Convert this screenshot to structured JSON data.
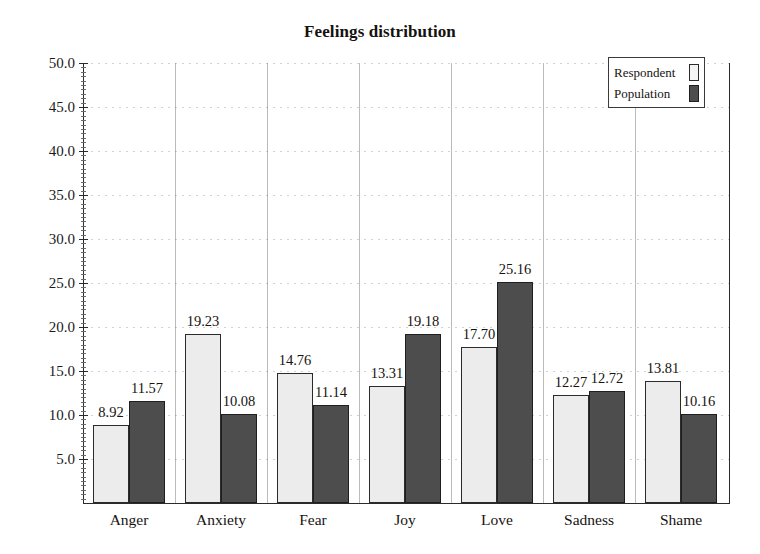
{
  "chart_data": {
    "type": "bar",
    "title": "Feelings distribution",
    "xlabel": "",
    "ylabel": "",
    "ylim": [
      0,
      50
    ],
    "ytick_step": 5,
    "grid": true,
    "legend_position": "top-right",
    "categories": [
      "Anger",
      "Anxiety",
      "Fear",
      "Joy",
      "Love",
      "Sadness",
      "Shame"
    ],
    "series": [
      {
        "name": "Respondent",
        "color": "#ececec",
        "values": [
          8.92,
          19.23,
          14.76,
          13.31,
          17.7,
          12.27,
          13.81
        ],
        "labels": [
          "8.92",
          "19.23",
          "14.76",
          "13.31",
          "17.70",
          "12.27",
          "13.81"
        ]
      },
      {
        "name": "Population",
        "color": "#4d4d4d",
        "values": [
          11.57,
          10.08,
          11.14,
          19.18,
          25.16,
          12.72,
          10.16
        ],
        "labels": [
          "11.57",
          "10.08",
          "11.14",
          "19.18",
          "25.16",
          "12.72",
          "10.16"
        ]
      }
    ],
    "yticks": [
      {
        "value": 50,
        "label": "50.0"
      },
      {
        "value": 45,
        "label": "45.0"
      },
      {
        "value": 40,
        "label": "40.0"
      },
      {
        "value": 35,
        "label": "35.0"
      },
      {
        "value": 30,
        "label": "30.0"
      },
      {
        "value": 25,
        "label": "25.0"
      },
      {
        "value": 20,
        "label": "20.0"
      },
      {
        "value": 15,
        "label": "15.0"
      },
      {
        "value": 10,
        "label": "10.0"
      },
      {
        "value": 5,
        "label": "5.0"
      }
    ]
  },
  "legend": {
    "items": [
      {
        "label": "Respondent",
        "swatch": "respondent"
      },
      {
        "label": "Population",
        "swatch": "population"
      }
    ]
  }
}
